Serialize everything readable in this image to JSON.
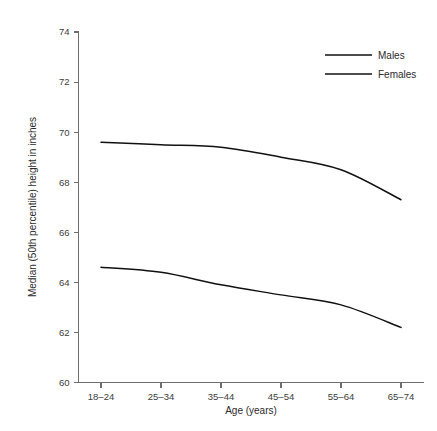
{
  "chart_data": {
    "type": "line",
    "title": "",
    "xlabel": "Age (years)",
    "ylabel": "Median (50th percentile) height in inches",
    "categories": [
      "18–24",
      "25–34",
      "35–44",
      "45–54",
      "55–64",
      "65–74"
    ],
    "ylim": [
      60,
      74
    ],
    "yticks": [
      60,
      62,
      64,
      66,
      68,
      70,
      72,
      74
    ],
    "ytick_labels": [
      "60",
      "62",
      "64",
      "66",
      "68",
      "70",
      "72",
      "74"
    ],
    "grid": false,
    "legend_position": "top-right",
    "series": [
      {
        "name": "Males",
        "color": "#111111",
        "values": [
          69.6,
          69.5,
          69.4,
          69.0,
          68.5,
          67.3
        ]
      },
      {
        "name": "Females",
        "color": "#111111",
        "values": [
          64.6,
          64.4,
          63.9,
          63.5,
          63.1,
          62.2
        ]
      }
    ]
  },
  "legend": {
    "entries": [
      {
        "label": "Males"
      },
      {
        "label": "Females"
      }
    ]
  },
  "axes": {
    "y_title": "Median (50th percentile) height in inches",
    "x_title": "Age (years)"
  },
  "colors": {
    "line": "#111111",
    "axis": "#6e6e6e",
    "text": "#2b2b2b",
    "background": "#ffffff"
  }
}
